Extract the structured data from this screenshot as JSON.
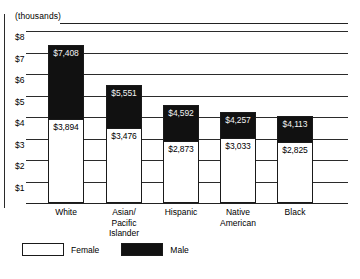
{
  "chart_data": {
    "type": "bar",
    "subtype": "stacked",
    "title": "",
    "subtitle": "",
    "unit_caption": "(thousands)",
    "xlabel": "",
    "ylabel": "",
    "categories": [
      "White",
      "Asian/\nPacific\nIslander",
      "Hispanic",
      "Native\nAmerican",
      "Black"
    ],
    "series": [
      {
        "name": "Female",
        "color": "#ffffff",
        "values": [
          3894,
          3476,
          2873,
          3033,
          2825
        ],
        "labels": [
          "$3,894",
          "$3,476",
          "$2,873",
          "$3,033",
          "$2,825"
        ]
      },
      {
        "name": "Male",
        "color": "#111111",
        "values": [
          7408,
          5551,
          4592,
          4257,
          4113
        ],
        "labels": [
          "$7,408",
          "$5,551",
          "$4,592",
          "$4,257",
          "$4,113"
        ]
      }
    ],
    "ylim": [
      0,
      8000
    ],
    "ytick_labels": [
      "$8",
      "$7",
      "$6",
      "$5",
      "$4",
      "$3",
      "$2",
      "$1"
    ],
    "ytick_values": [
      8000,
      7000,
      6000,
      5000,
      4000,
      3000,
      2000,
      1000
    ],
    "grid": true,
    "legend_position": "bottom-left"
  },
  "legend": {
    "female_label": "Female",
    "male_label": "Male"
  }
}
